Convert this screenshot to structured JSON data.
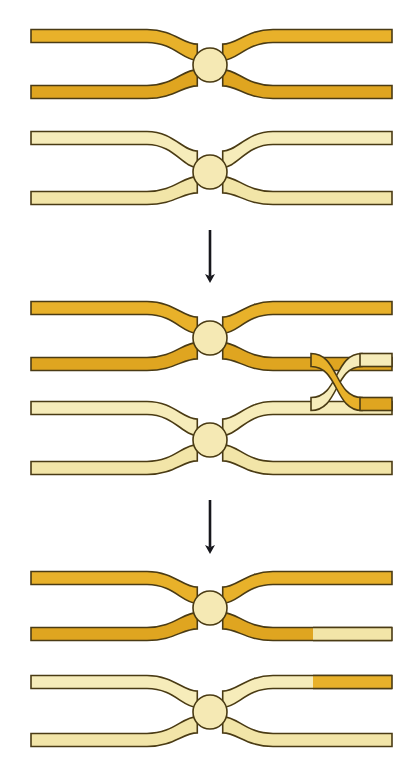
{
  "figure": {
    "canvas": {
      "width": 417,
      "height": 774,
      "background": "#ffffff"
    },
    "colors": {
      "dark_duplex_fill": "#E8B12A",
      "dark_duplex_fill_alt": "#DFA520",
      "pale_duplex_fill": "#F6ECBA",
      "pale_duplex_fill_alt": "#F2E5A8",
      "junction_fill": "#F5E9B4",
      "outline": "#4a3b14",
      "arrow": "#17171c",
      "background": "#ffffff"
    },
    "legend_note": "Dark gold = first DNA duplex; pale cream = second DNA duplex; circle = recombinase synapse"
  },
  "stages": [
    {
      "id": "stage-1",
      "name": "parental-duplexes",
      "label": "Two parental DNA duplexes each bent around a recombinase synapse",
      "arrow_after": true,
      "duplexes": [
        {
          "id": "duplex-top-dark",
          "color_key": "dark",
          "strand_count": 2,
          "junction": {
            "cx": 210,
            "cy": 65,
            "r": 17
          },
          "strands": [
            {
              "id": "s1",
              "y": 36,
              "segments": [
                {
                  "from_x": 31,
                  "to_x": 392,
                  "color_key": "dark"
                }
              ]
            },
            {
              "id": "s2",
              "y": 92,
              "segments": [
                {
                  "from_x": 31,
                  "to_x": 392,
                  "color_key": "dark"
                }
              ]
            }
          ]
        },
        {
          "id": "duplex-bottom-pale",
          "color_key": "pale",
          "strand_count": 2,
          "junction": {
            "cx": 210,
            "cy": 172,
            "r": 17
          },
          "strands": [
            {
              "id": "s3",
              "y": 138,
              "segments": [
                {
                  "from_x": 31,
                  "to_x": 392,
                  "color_key": "pale"
                }
              ]
            },
            {
              "id": "s4",
              "y": 198,
              "segments": [
                {
                  "from_x": 31,
                  "to_x": 392,
                  "color_key": "pale"
                }
              ]
            }
          ]
        }
      ]
    },
    {
      "id": "stage-2",
      "name": "strand-exchange-crossover",
      "label": "Single-strand exchange: one dark strand crosses into the pale duplex forming an X crossover",
      "arrow_after": true,
      "crossover": {
        "x_start": 313,
        "x_end": 360,
        "y_upper": 360,
        "y_lower": 404
      },
      "duplexes": [
        {
          "id": "duplex-top-dark-2",
          "color_key": "dark",
          "strand_count": 2,
          "junction": {
            "cx": 210,
            "cy": 338,
            "r": 17
          },
          "strands": [
            {
              "id": "s1",
              "y": 308,
              "segments": [
                {
                  "from_x": 31,
                  "to_x": 392,
                  "color_key": "dark"
                }
              ]
            },
            {
              "id": "s2",
              "y": 364,
              "segments": [
                {
                  "from_x": 31,
                  "to_x": 313,
                  "color_key": "dark"
                }
              ]
            }
          ]
        },
        {
          "id": "duplex-bottom-pale-2",
          "color_key": "pale",
          "strand_count": 2,
          "junction": {
            "cx": 210,
            "cy": 440,
            "r": 17
          },
          "strands": [
            {
              "id": "s3",
              "y": 408,
              "segments": [
                {
                  "from_x": 31,
                  "to_x": 313,
                  "color_key": "pale"
                }
              ]
            },
            {
              "id": "s4",
              "y": 468,
              "segments": [
                {
                  "from_x": 31,
                  "to_x": 392,
                  "color_key": "pale"
                }
              ]
            }
          ]
        }
      ]
    },
    {
      "id": "stage-3",
      "name": "recombinant-products",
      "label": "Recombinant products: each duplex now carries a swapped strand segment at its right arm",
      "arrow_after": false,
      "swap_boundary_x": 313,
      "duplexes": [
        {
          "id": "duplex-top-recombinant",
          "color_key": "dark",
          "strand_count": 2,
          "junction": {
            "cx": 210,
            "cy": 608,
            "r": 17
          },
          "strands": [
            {
              "id": "s1",
              "y": 578,
              "segments": [
                {
                  "from_x": 31,
                  "to_x": 392,
                  "color_key": "dark"
                }
              ]
            },
            {
              "id": "s2",
              "y": 634,
              "segments": [
                {
                  "from_x": 31,
                  "to_x": 313,
                  "color_key": "dark"
                },
                {
                  "from_x": 313,
                  "to_x": 392,
                  "color_key": "pale"
                }
              ]
            }
          ]
        },
        {
          "id": "duplex-bottom-recombinant",
          "color_key": "pale",
          "strand_count": 2,
          "junction": {
            "cx": 210,
            "cy": 712,
            "r": 17
          },
          "strands": [
            {
              "id": "s3",
              "y": 682,
              "segments": [
                {
                  "from_x": 31,
                  "to_x": 313,
                  "color_key": "pale"
                },
                {
                  "from_x": 313,
                  "to_x": 392,
                  "color_key": "dark"
                }
              ]
            },
            {
              "id": "s4",
              "y": 740,
              "segments": [
                {
                  "from_x": 31,
                  "to_x": 392,
                  "color_key": "pale"
                }
              ]
            }
          ]
        }
      ]
    }
  ],
  "arrows": [
    {
      "id": "arrow-1",
      "x": 210,
      "y_start": 230,
      "y_end": 285,
      "direction": "down"
    },
    {
      "id": "arrow-2",
      "x": 210,
      "y_start": 500,
      "y_end": 556,
      "direction": "down"
    }
  ]
}
